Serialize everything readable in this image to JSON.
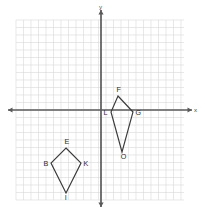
{
  "figure": {
    "background_color": "#ffffff"
  },
  "axes": {
    "x_label": "x",
    "y_label": "y",
    "axis_color": "#5a5a5a",
    "grid_color": "#d8d8d8",
    "grid_visible": true,
    "tick_labels_visible": false,
    "origin_grid_col": 11.5,
    "origin_grid_row": 12
  },
  "chart_data": {
    "type": "scatter",
    "title": "",
    "xlabel": "x",
    "ylabel": "y",
    "grid": true,
    "legend": null,
    "xlim": [
      -11.5,
      11.0
    ],
    "ylim": [
      -12.0,
      12.0
    ],
    "unit_px": 7.5,
    "series": [
      {
        "name": "Kite BEKI",
        "closed": true,
        "stroke": "#3a3a3a",
        "points": [
          {
            "label": "E",
            "x": -4.7,
            "y": 5.2,
            "label_dx": -1.5,
            "label_dy": -4
          },
          {
            "label": "K",
            "x": -2.7,
            "y": 7.2,
            "label_dx": 2.5,
            "label_dy": 2.5
          },
          {
            "label": "I",
            "x": -4.7,
            "y": 11.2,
            "label_dx": -1.2,
            "label_dy": 7
          },
          {
            "label": "B",
            "x": -6.7,
            "y": 7.2,
            "label_dx": -7.5,
            "label_dy": 2.5
          }
        ]
      },
      {
        "name": "Kite FGOL",
        "closed": true,
        "stroke": "#3a3a3a",
        "points": [
          {
            "label": "F",
            "x": 2.3,
            "y": -1.7,
            "label_dx": -1.5,
            "label_dy": -4
          },
          {
            "label": "G",
            "x": 4.3,
            "y": 0.4,
            "label_dx": 2.5,
            "label_dy": 3
          },
          {
            "label": "O",
            "x": 2.8,
            "y": 5.7,
            "label_dx": -1.2,
            "label_dy": 7
          },
          {
            "label": "L",
            "x": 1.3,
            "y": 0.4,
            "label_dx": -7.5,
            "label_dy": 3
          }
        ]
      }
    ]
  },
  "shapes": [
    {
      "id": "kite-beki",
      "name": "Kite BEKI",
      "vertices": [
        {
          "label": "E",
          "px": 66,
          "py": 148,
          "lx": 64.5,
          "ly": 144
        },
        {
          "label": "K",
          "px": 81,
          "py": 163,
          "lx": 83.5,
          "ly": 165.5
        },
        {
          "label": "I",
          "px": 66,
          "py": 193,
          "lx": 64.8,
          "ly": 200
        },
        {
          "label": "B",
          "px": 51,
          "py": 163,
          "lx": 43.5,
          "ly": 165.5
        }
      ]
    },
    {
      "id": "kite-fgol",
      "name": "Kite FGOL",
      "vertices": [
        {
          "label": "F",
          "px": 118,
          "py": 96,
          "lx": 116.5,
          "ly": 92
        },
        {
          "label": "G",
          "px": 133,
          "py": 112,
          "lx": 135.5,
          "ly": 115
        },
        {
          "label": "O",
          "px": 122,
          "py": 152,
          "lx": 120.8,
          "ly": 159
        },
        {
          "label": "L",
          "px": 111,
          "py": 112,
          "lx": 103.5,
          "ly": 115
        }
      ]
    }
  ],
  "grid_geometry": {
    "left_px": 16,
    "top_px": 20,
    "right_px": 184,
    "bottom_px": 200,
    "cell_px": 7.5,
    "cols": 22,
    "rows": 24,
    "origin_x_px": 101,
    "origin_y_px": 110,
    "x_axis_start_px": 8,
    "x_axis_end_px": 192,
    "y_axis_start_px": 10,
    "y_axis_end_px": 207
  }
}
